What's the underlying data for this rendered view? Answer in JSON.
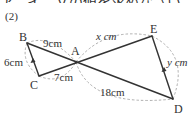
{
  "problem": {
    "number_label": "(2)",
    "top_cut_text": "ア，イ，ｙの値を求めなさい。"
  },
  "points": {
    "A": "A",
    "B": "B",
    "C": "C",
    "D": "D",
    "E": "E"
  },
  "lengths": {
    "AB": "9cm",
    "BC": "6cm",
    "AC": "7cm",
    "AE": "x cm",
    "ED": "y cm",
    "AD": "18cm"
  },
  "colors": {
    "segment": "#333333",
    "arc": "#9a9a9a",
    "text": "#333333"
  }
}
